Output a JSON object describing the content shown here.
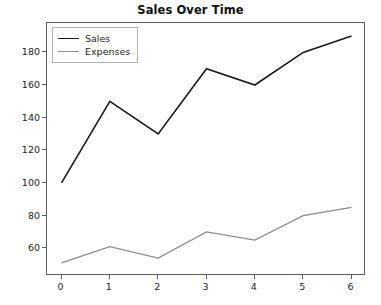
{
  "chart_data": {
    "type": "line",
    "title": "Sales Over Time",
    "xlabel": "",
    "ylabel": "",
    "x": [
      0,
      1,
      2,
      3,
      4,
      5,
      6
    ],
    "xticklabels": [
      "0",
      "1",
      "2",
      "3",
      "4",
      "5",
      "6"
    ],
    "yticklabels": [
      "60",
      "80",
      "100",
      "120",
      "140",
      "160",
      "180"
    ],
    "yticks": [
      60,
      80,
      100,
      120,
      140,
      160,
      180
    ],
    "xlim": [
      -0.3,
      6.3
    ],
    "ylim": [
      43,
      198
    ],
    "grid": false,
    "legend_position": "upper left",
    "series": [
      {
        "name": "Sales",
        "color": "#1a1a1a",
        "values": [
          100,
          150,
          130,
          170,
          160,
          180,
          190
        ]
      },
      {
        "name": "Expenses",
        "color": "#8c8c8c",
        "values": [
          51,
          61,
          54,
          70,
          65,
          80,
          85
        ]
      }
    ]
  },
  "figure": {
    "background": "#ffffff",
    "axes_edge_color": "#5a5a5a",
    "tick_label_color": "#1c1c1c",
    "legend_border_color": "#b0b0b0"
  }
}
